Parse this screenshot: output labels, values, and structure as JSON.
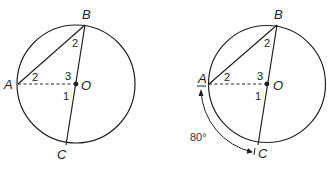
{
  "figures": [
    {
      "id": "left",
      "points": {
        "A": "A",
        "B": "B",
        "C": "C",
        "O": "O"
      },
      "angles": {
        "at_B": "2",
        "at_A": "2",
        "above_O": "3",
        "below_O": "1"
      }
    },
    {
      "id": "right",
      "points": {
        "A": "A",
        "B": "B",
        "C": "C",
        "O": "O"
      },
      "angles": {
        "at_B": "2",
        "at_A": "2",
        "above_O": "3",
        "below_O": "1"
      },
      "arc_label": "80°"
    }
  ],
  "colors": {
    "stroke": "#222222",
    "background": "#ffffff"
  }
}
